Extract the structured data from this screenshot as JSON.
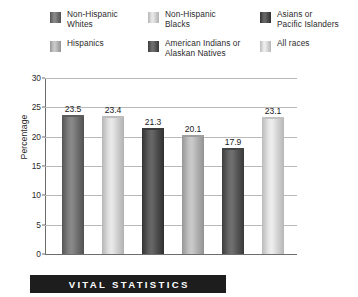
{
  "banner": {
    "text": "VITAL STATISTICS",
    "background": "#1d1d1d",
    "color": "#ffffff"
  },
  "legend": {
    "position": "top",
    "entries": [
      {
        "label": "Non-Hispanic\nWhites",
        "color": "#6f6f6f",
        "row": 0,
        "col": 0
      },
      {
        "label": "Non-Hispanic\nBlacks",
        "color": "#cfcfcf",
        "row": 0,
        "col": 1
      },
      {
        "label": "Asians or\nPacific Islanders",
        "color": "#4d4d4d",
        "row": 0,
        "col": 2
      },
      {
        "label": "Hispanics",
        "color": "#b0b0b0",
        "row": 1,
        "col": 0
      },
      {
        "label": "American Indians or\nAlaskan Natives",
        "color": "#565656",
        "row": 1,
        "col": 1
      },
      {
        "label": "All races",
        "color": "#d4d4d4",
        "row": 1,
        "col": 2
      }
    ]
  },
  "chart_data": {
    "type": "bar",
    "title": "",
    "xlabel": "",
    "ylabel": "Percentage",
    "ylim": [
      0,
      30
    ],
    "yticks": [
      0,
      5,
      10,
      15,
      20,
      25,
      30
    ],
    "ytick_labels": [
      "0",
      "5",
      "10",
      "15",
      "20",
      "25",
      "30"
    ],
    "grid": true,
    "grid_axis": "y",
    "legend_position": "top",
    "categories": [
      "Non-Hispanic Whites",
      "Non-Hispanic Blacks",
      "Asians or Pacific Islanders",
      "Hispanics",
      "American Indians or Alaskan Natives",
      "All races"
    ],
    "values": [
      23.5,
      23.4,
      21.3,
      20.1,
      17.9,
      23.1
    ],
    "value_labels": [
      "23.5",
      "23.4",
      "21.3",
      "20.1",
      "17.9",
      "23.1"
    ],
    "bar_colors": [
      "#6f6f6f",
      "#cfcfcf",
      "#4d4d4d",
      "#b0b0b0",
      "#565656",
      "#d4d4d4"
    ]
  },
  "colors": {
    "gridline": "#b9b9b9",
    "axis": "#6d6d6d",
    "text": "#2b2b2b"
  }
}
